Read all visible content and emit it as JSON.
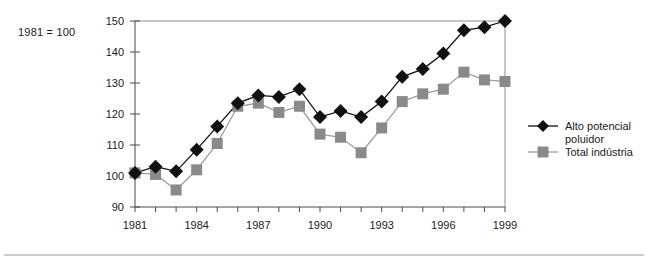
{
  "figure": {
    "base_note": "1981 = 100",
    "colors": {
      "series_a": "#111111",
      "series_b": "#8a8a8a",
      "axis": "#4a4a4a",
      "frame": "#8c8c8c",
      "background": "#ffffff"
    }
  },
  "legend": {
    "position": "right",
    "entries": [
      {
        "label_line1": "Alto potencial",
        "label_line2": "poluidor",
        "marker": "diamond",
        "color": "#111111"
      },
      {
        "label_line1": "Total indústria",
        "label_line2": "",
        "marker": "square",
        "color": "#8a8a8a"
      }
    ]
  },
  "chart_data": {
    "type": "line",
    "title": "",
    "subtitle": "",
    "xlabel": "",
    "ylabel": "",
    "note": "1981 = 100",
    "grid": false,
    "legend_position": "right",
    "x": [
      1981,
      1982,
      1983,
      1984,
      1985,
      1986,
      1987,
      1988,
      1989,
      1990,
      1991,
      1992,
      1993,
      1994,
      1995,
      1996,
      1997,
      1998,
      1999
    ],
    "xlim": [
      1981,
      1999
    ],
    "ylim": [
      90,
      150
    ],
    "xticks": [
      1981,
      1984,
      1987,
      1990,
      1993,
      1996,
      1999
    ],
    "xtick_labels": [
      "1981",
      "1984",
      "1987",
      "1990",
      "1993",
      "1996",
      "1999"
    ],
    "yticks": [
      90,
      100,
      110,
      120,
      130,
      140,
      150
    ],
    "ytick_labels": [
      "90",
      "100",
      "110",
      "120",
      "130",
      "140",
      "150"
    ],
    "series": [
      {
        "name": "Alto potencial poluidor",
        "marker": "diamond",
        "color": "#111111",
        "values": [
          101,
          103,
          101.5,
          108.5,
          116,
          123.5,
          126,
          125.5,
          128,
          119,
          121,
          119,
          124,
          132,
          134.5,
          139.5,
          147,
          148,
          150
        ]
      },
      {
        "name": "Total indústria",
        "marker": "square",
        "color": "#8a8a8a",
        "values": [
          101,
          100.5,
          95.5,
          102,
          110.5,
          122.5,
          123.5,
          120.5,
          122.5,
          113.5,
          112.5,
          107.5,
          115.5,
          124,
          126.5,
          128,
          133.5,
          131,
          130.5
        ]
      }
    ]
  }
}
